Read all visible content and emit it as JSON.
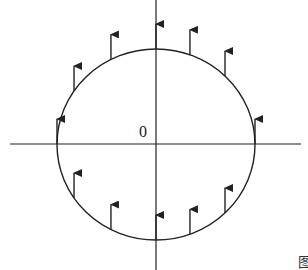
{
  "diagram": {
    "origin_label": "0",
    "figure_label_fragment": "图",
    "colors": {
      "stroke": "#222222",
      "background": "#ffffff",
      "label": "#333333"
    },
    "vectors": {
      "direction": "up",
      "count": 12,
      "positions": [
        {
          "id": "top-center",
          "half": "upper",
          "x_frac": 0.0
        },
        {
          "id": "upper-left-1",
          "half": "upper",
          "x_frac": -0.455
        },
        {
          "id": "upper-left-2",
          "half": "upper",
          "x_frac": -0.828
        },
        {
          "id": "upper-right-1",
          "half": "upper",
          "x_frac": 0.343
        },
        {
          "id": "upper-right-2",
          "half": "upper",
          "x_frac": 0.697
        },
        {
          "id": "left-edge",
          "half": "upper",
          "x_frac": -1.0
        },
        {
          "id": "right-edge",
          "half": "upper",
          "x_frac": 1.0
        },
        {
          "id": "lower-left-2",
          "half": "lower",
          "x_frac": -0.828
        },
        {
          "id": "lower-left-1",
          "half": "lower",
          "x_frac": -0.455
        },
        {
          "id": "bottom-center",
          "half": "lower",
          "x_frac": 0.0
        },
        {
          "id": "lower-right-1",
          "half": "lower",
          "x_frac": 0.343
        },
        {
          "id": "lower-right-2",
          "half": "lower",
          "x_frac": 0.697
        }
      ]
    }
  }
}
